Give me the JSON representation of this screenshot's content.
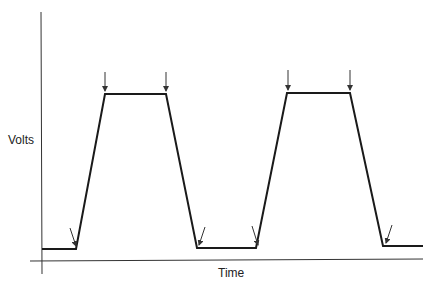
{
  "diagram": {
    "title": "",
    "y_axis_label": "Volts",
    "x_axis_label": "Time",
    "waveform": "trapezoidal pulse train",
    "waveform_points": [
      [
        42,
        249
      ],
      [
        76,
        249
      ],
      [
        105,
        94
      ],
      [
        166,
        94
      ],
      [
        197,
        248
      ],
      [
        256,
        248
      ],
      [
        287,
        93
      ],
      [
        350,
        93
      ],
      [
        383,
        246
      ],
      [
        423,
        246
      ]
    ],
    "arrows": [
      {
        "x1": 70,
        "y1": 228,
        "x2": 76,
        "y2": 246,
        "position": "rise-start-1"
      },
      {
        "x1": 105,
        "y1": 72,
        "x2": 105,
        "y2": 91,
        "position": "rise-end-1"
      },
      {
        "x1": 166,
        "y1": 72,
        "x2": 166,
        "y2": 91,
        "position": "fall-start-1"
      },
      {
        "x1": 205,
        "y1": 227,
        "x2": 199,
        "y2": 245,
        "position": "fall-end-1"
      },
      {
        "x1": 252,
        "y1": 226,
        "x2": 258,
        "y2": 245,
        "position": "rise-start-2"
      },
      {
        "x1": 288,
        "y1": 70,
        "x2": 288,
        "y2": 90,
        "position": "rise-end-2"
      },
      {
        "x1": 350,
        "y1": 70,
        "x2": 350,
        "y2": 90,
        "position": "fall-start-2"
      },
      {
        "x1": 392,
        "y1": 225,
        "x2": 386,
        "y2": 243,
        "position": "fall-end-2"
      }
    ],
    "colors": {
      "line": "#1a1a1a",
      "axis": "#333333",
      "arrow": "#333333"
    }
  }
}
